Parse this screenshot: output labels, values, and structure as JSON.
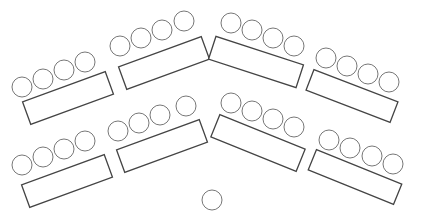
{
  "diagram": {
    "type": "seating-layout",
    "colors": {
      "table_stroke": "#444444",
      "chair_stroke": "#777777",
      "background": "#ffffff"
    },
    "chair_radius": 10,
    "rows": [
      {
        "name": "front-row",
        "tables": [
          {
            "id": "t1",
            "cx": 68,
            "cy": 98,
            "w": 88,
            "h": 24,
            "angle": -20,
            "chairs": [
              [
                22,
                87
              ],
              [
                43,
                79
              ],
              [
                64,
                70
              ],
              [
                85,
                62
              ]
            ]
          },
          {
            "id": "t2",
            "cx": 164,
            "cy": 63,
            "w": 88,
            "h": 24,
            "angle": -20,
            "chairs": [
              [
                120,
                46
              ],
              [
                141,
                38
              ],
              [
                162,
                30
              ],
              [
                184,
                21
              ]
            ]
          },
          {
            "id": "t3",
            "cx": 256,
            "cy": 62,
            "w": 92,
            "h": 24,
            "angle": 18,
            "chairs": [
              [
                231,
                23
              ],
              [
                252,
                30
              ],
              [
                273,
                38
              ],
              [
                294,
                46
              ]
            ]
          },
          {
            "id": "t4",
            "cx": 352,
            "cy": 96,
            "w": 90,
            "h": 22,
            "angle": 21,
            "chairs": [
              [
                326,
                58
              ],
              [
                347,
                66
              ],
              [
                368,
                74
              ],
              [
                389,
                82
              ]
            ]
          }
        ]
      },
      {
        "name": "back-row",
        "tables": [
          {
            "id": "t5",
            "cx": 67,
            "cy": 181,
            "w": 88,
            "h": 24,
            "angle": -20,
            "chairs": [
              [
                22,
                165
              ],
              [
                43,
                157
              ],
              [
                64,
                149
              ],
              [
                85,
                141
              ]
            ]
          },
          {
            "id": "t6",
            "cx": 162,
            "cy": 146,
            "w": 88,
            "h": 24,
            "angle": -20,
            "chairs": [
              [
                118,
                131
              ],
              [
                139,
                123
              ],
              [
                160,
                115
              ],
              [
                186,
                106
              ]
            ]
          },
          {
            "id": "t7",
            "cx": 258,
            "cy": 143,
            "w": 92,
            "h": 24,
            "angle": 22,
            "chairs": [
              [
                231,
                103
              ],
              [
                252,
                111
              ],
              [
                273,
                119
              ],
              [
                294,
                127
              ]
            ]
          },
          {
            "id": "t8",
            "cx": 355,
            "cy": 177,
            "w": 92,
            "h": 22,
            "angle": 22,
            "chairs": [
              [
                329,
                140
              ],
              [
                350,
                148
              ],
              [
                372,
                156
              ],
              [
                393,
                164
              ]
            ]
          }
        ]
      }
    ],
    "presenter_chair": {
      "cx": 212,
      "cy": 200,
      "r": 10
    }
  }
}
